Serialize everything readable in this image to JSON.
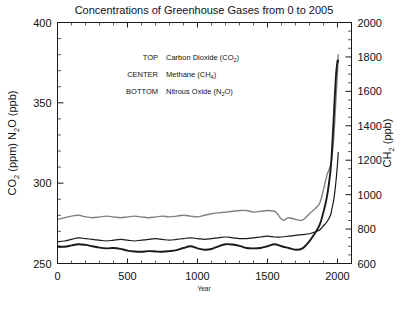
{
  "chart_data": {
    "type": "line",
    "title": "Concentrations of Greenhouse Gases from 0 to 2005",
    "xlabel": "Year",
    "ylabel_left": "CO2 (ppm) N2O (ppb)",
    "ylabel_right": "CH2 (ppb)",
    "xlim": [
      0,
      2100
    ],
    "ylim_left": [
      250,
      400
    ],
    "ylim_right": [
      600,
      2000
    ],
    "xticks": [
      0,
      500,
      1000,
      1500,
      2000
    ],
    "yticks_left": [
      250,
      300,
      350,
      400
    ],
    "yticks_right": [
      600,
      800,
      1000,
      1200,
      1400,
      1600,
      1800,
      2000
    ],
    "x_minor_step": 100,
    "y_left_minor_step": 10,
    "y_right_minor_step": 50,
    "grid": false,
    "legend_position": "upper-center-inside",
    "legend": [
      {
        "key": "TOP",
        "label": "Carbon Dioxide (CO",
        "sub": "2",
        "tail": ")"
      },
      {
        "key": "CENTER",
        "label": "Methane (CH",
        "sub": "4",
        "tail": ")"
      },
      {
        "key": "BOTTOM",
        "label": "Nitrous Oxide (N",
        "sub": "2",
        "tail": "O)"
      }
    ],
    "axis_title_left_parts": [
      {
        "text": "CO",
        "sub": false
      },
      {
        "text": "2",
        "sub": true
      },
      {
        "text": " (ppm) N",
        "sub": false
      },
      {
        "text": "2",
        "sub": true
      },
      {
        "text": "O (ppb)",
        "sub": false
      }
    ],
    "axis_title_right_parts": [
      {
        "text": "CH",
        "sub": false
      },
      {
        "text": "2",
        "sub": true
      },
      {
        "text": " (ppb)",
        "sub": false
      }
    ],
    "series": [
      {
        "name": "Carbon Dioxide (CO2)",
        "position": "TOP",
        "color": "#808080",
        "width": 1.4,
        "axis": "left",
        "units": "ppm",
        "x": [
          0,
          50,
          100,
          150,
          200,
          250,
          300,
          350,
          400,
          450,
          500,
          550,
          600,
          650,
          700,
          750,
          800,
          850,
          900,
          950,
          1000,
          1050,
          1100,
          1150,
          1200,
          1250,
          1300,
          1350,
          1400,
          1450,
          1500,
          1550,
          1570,
          1600,
          1620,
          1650,
          1700,
          1750,
          1800,
          1850,
          1875,
          1900,
          1925,
          1950,
          1960,
          1970,
          1980,
          1990,
          2000,
          2005
        ],
        "y": [
          277.5,
          278.5,
          279.5,
          280.0,
          279.0,
          278.5,
          279.0,
          279.5,
          279.0,
          278.5,
          279.0,
          279.5,
          279.0,
          278.5,
          279.0,
          279.5,
          279.0,
          279.5,
          280.0,
          279.5,
          279.0,
          280.0,
          281.0,
          281.5,
          282.0,
          282.5,
          283.0,
          283.0,
          282.0,
          282.5,
          283.0,
          282.5,
          281.0,
          277.5,
          277.0,
          278.5,
          277.5,
          277.0,
          281.0,
          285.0,
          288.0,
          296.0,
          305.0,
          311.0,
          316.0,
          325.0,
          338.0,
          354.0,
          369.0,
          380.0
        ]
      },
      {
        "name": "Methane (CH4)",
        "position": "CENTER",
        "color": "#1a1a1a",
        "width": 1.9,
        "axis": "right",
        "units": "ppb",
        "x": [
          0,
          50,
          100,
          150,
          200,
          250,
          300,
          350,
          400,
          450,
          500,
          550,
          600,
          650,
          700,
          750,
          800,
          850,
          900,
          950,
          1000,
          1050,
          1100,
          1150,
          1200,
          1250,
          1300,
          1350,
          1400,
          1450,
          1500,
          1550,
          1600,
          1650,
          1700,
          1750,
          1800,
          1850,
          1875,
          1900,
          1925,
          1950,
          1960,
          1970,
          1980,
          1990,
          2000,
          2005
        ],
        "y": [
          700,
          697,
          705,
          712,
          708,
          700,
          692,
          688,
          690,
          685,
          675,
          670,
          668,
          672,
          670,
          668,
          672,
          678,
          690,
          700,
          688,
          680,
          684,
          700,
          712,
          710,
          702,
          690,
          688,
          690,
          700,
          712,
          700,
          690,
          680,
          688,
          730,
          790,
          830,
          900,
          990,
          1140,
          1250,
          1400,
          1560,
          1700,
          1775,
          1775
        ]
      },
      {
        "name": "Nitrous Oxide (N2O)",
        "position": "BOTTOM",
        "color": "#1a1a1a",
        "width": 1.2,
        "axis": "left",
        "units": "ppb",
        "x": [
          0,
          50,
          100,
          150,
          200,
          250,
          300,
          350,
          400,
          450,
          500,
          550,
          600,
          650,
          700,
          750,
          800,
          850,
          900,
          950,
          1000,
          1050,
          1100,
          1150,
          1200,
          1250,
          1300,
          1350,
          1400,
          1450,
          1500,
          1550,
          1600,
          1650,
          1700,
          1750,
          1800,
          1850,
          1875,
          1900,
          1925,
          1950,
          1960,
          1970,
          1980,
          1990,
          2000,
          2005
        ],
        "y": [
          263.5,
          264.0,
          265.0,
          266.0,
          265.5,
          265.0,
          264.5,
          264.0,
          264.5,
          265.0,
          264.5,
          264.0,
          264.5,
          265.0,
          265.5,
          265.0,
          264.5,
          265.0,
          265.5,
          266.0,
          265.5,
          265.0,
          265.5,
          266.0,
          266.5,
          266.0,
          265.5,
          265.5,
          266.0,
          266.5,
          267.0,
          266.5,
          266.5,
          267.0,
          267.5,
          268.0,
          268.5,
          270.0,
          271.0,
          273.5,
          276.0,
          280.0,
          284.0,
          288.0,
          294.0,
          302.0,
          312.0,
          319.0
        ]
      }
    ]
  }
}
